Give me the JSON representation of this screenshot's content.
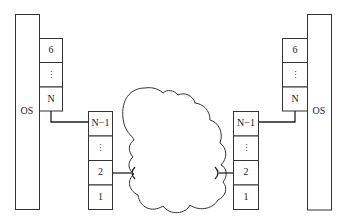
{
  "diagram": {
    "left_host": {
      "os_label": "OS",
      "upper_stack": [
        "6",
        "⋮",
        "N"
      ],
      "lower_stack": [
        "N−1",
        "⋮",
        "2",
        "1"
      ]
    },
    "right_host": {
      "os_label": "OS",
      "upper_stack": [
        "6",
        "⋮",
        "N"
      ],
      "lower_stack": [
        "N−1",
        "⋮",
        "2",
        "1"
      ]
    },
    "network": "cloud"
  }
}
